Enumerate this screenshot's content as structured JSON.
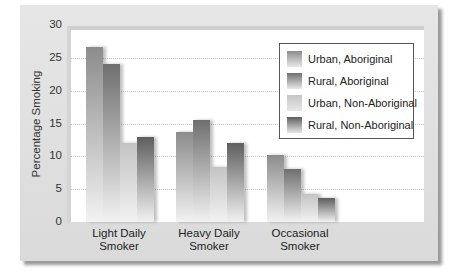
{
  "chart_data": {
    "type": "bar",
    "title": "",
    "xlabel": "",
    "ylabel": "Percentage Smoking",
    "ylim": [
      0,
      30
    ],
    "yticks": [
      "0",
      "5",
      "10",
      "15",
      "20",
      "25",
      "30"
    ],
    "grid": true,
    "legend_position": "upper right (inside)",
    "categories": [
      "Light Daily Smoker",
      "Heavy Daily Smoker",
      "Occasional Smoker"
    ],
    "category_lines": [
      [
        "Light Daily",
        "Smoker"
      ],
      [
        "Heavy Daily",
        "Smoker"
      ],
      [
        "Occasional",
        "Smoker"
      ]
    ],
    "series": [
      {
        "name": "Urban, Aboriginal",
        "values": [
          26.7,
          13.7,
          10.2
        ],
        "color": "#8c8c8c"
      },
      {
        "name": "Rural, Aboriginal",
        "values": [
          24.1,
          15.6,
          8.1
        ],
        "color": "#6f6f6f"
      },
      {
        "name": "Urban, Non-Aboriginal",
        "values": [
          12.1,
          8.4,
          4.2
        ],
        "color": "#c4c4c4"
      },
      {
        "name": "Rural, Non-Aboriginal",
        "values": [
          12.9,
          12.0,
          3.6
        ],
        "color": "#5e5e5e"
      }
    ]
  }
}
